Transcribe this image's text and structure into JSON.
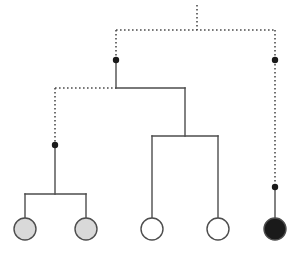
{
  "figure": {
    "width": 302,
    "height": 257,
    "background_color": "#ffffff"
  },
  "style": {
    "line_color": "#4d4d4d",
    "dotted_color": "#4d4d4d",
    "node_dot_color": "#1a1a1a",
    "circle_stroke_color": "#4d4d4d",
    "line_width": 1.4,
    "dotted_width": 1.6,
    "dash_pattern": "1.6 2.4",
    "node_dot_radius": 3.2,
    "taxon_radius": 11,
    "taxon_stroke_width": 1.4
  },
  "colors": {
    "gray_fill": "#d9d9d9",
    "white_fill": "#ffffff",
    "black_fill": "#1a1a1a"
  },
  "chart_data": {
    "type": "tree",
    "orientation": "top-down",
    "leaf_baseline_y": 229,
    "taxa": [
      {
        "id": "t1",
        "label": "",
        "x": 25,
        "y": 229,
        "fill": "#d9d9d9",
        "state": "gray"
      },
      {
        "id": "t2",
        "label": "",
        "x": 86,
        "y": 229,
        "fill": "#d9d9d9",
        "state": "gray"
      },
      {
        "id": "t3",
        "label": "",
        "x": 152,
        "y": 229,
        "fill": "#ffffff",
        "state": "white"
      },
      {
        "id": "t4",
        "label": "",
        "x": 218,
        "y": 229,
        "fill": "#ffffff",
        "state": "white"
      },
      {
        "id": "t5",
        "label": "",
        "x": 275,
        "y": 229,
        "fill": "#1a1a1a",
        "state": "black"
      }
    ],
    "node_dots": [
      {
        "id": "n1",
        "x": 116,
        "y": 60
      },
      {
        "id": "n2",
        "x": 275,
        "y": 60
      },
      {
        "id": "n3",
        "x": 55,
        "y": 145
      },
      {
        "id": "n4",
        "x": 275,
        "y": 187
      }
    ],
    "segments": [
      {
        "id": "root-stem",
        "kind": "dotted",
        "x1": 197,
        "y1": 5,
        "x2": 197,
        "y2": 30
      },
      {
        "id": "root-crossbar",
        "kind": "dotted",
        "x1": 116,
        "y1": 30,
        "x2": 275,
        "y2": 30
      },
      {
        "id": "left-clade-stem",
        "kind": "dotted",
        "x1": 116,
        "y1": 30,
        "x2": 116,
        "y2": 60
      },
      {
        "id": "right-stem-upper",
        "kind": "dotted",
        "x1": 275,
        "y1": 30,
        "x2": 275,
        "y2": 60
      },
      {
        "id": "left-clade-solid",
        "kind": "solid",
        "x1": 116,
        "y1": 60,
        "x2": 116,
        "y2": 88
      },
      {
        "id": "right-stem-lower",
        "kind": "dotted",
        "x1": 275,
        "y1": 60,
        "x2": 275,
        "y2": 187
      },
      {
        "id": "cross-dotted",
        "kind": "dotted",
        "x1": 55,
        "y1": 88,
        "x2": 116,
        "y2": 88
      },
      {
        "id": "cross-solid",
        "kind": "solid",
        "x1": 116,
        "y1": 88,
        "x2": 185,
        "y2": 88
      },
      {
        "id": "gray-clade-stem",
        "kind": "dotted",
        "x1": 55,
        "y1": 88,
        "x2": 55,
        "y2": 145
      },
      {
        "id": "mid-clade-stem",
        "kind": "solid",
        "x1": 185,
        "y1": 88,
        "x2": 185,
        "y2": 136
      },
      {
        "id": "mid-crossbar",
        "kind": "solid",
        "x1": 152,
        "y1": 136,
        "x2": 218,
        "y2": 136
      },
      {
        "id": "gray-clade-solid",
        "kind": "solid",
        "x1": 55,
        "y1": 145,
        "x2": 55,
        "y2": 194
      },
      {
        "id": "gray-crossbar",
        "kind": "solid",
        "x1": 25,
        "y1": 194,
        "x2": 86,
        "y2": 194
      },
      {
        "id": "black-tip-stem",
        "kind": "solid",
        "x1": 275,
        "y1": 187,
        "x2": 275,
        "y2": 218
      },
      {
        "id": "tip-stem-t1",
        "kind": "solid",
        "x1": 25,
        "y1": 194,
        "x2": 25,
        "y2": 218
      },
      {
        "id": "tip-stem-t2",
        "kind": "solid",
        "x1": 86,
        "y1": 194,
        "x2": 86,
        "y2": 218
      },
      {
        "id": "tip-stem-t3",
        "kind": "solid",
        "x1": 152,
        "y1": 136,
        "x2": 152,
        "y2": 218
      },
      {
        "id": "tip-stem-t4",
        "kind": "solid",
        "x1": 218,
        "y1": 136,
        "x2": 218,
        "y2": 218
      }
    ]
  }
}
